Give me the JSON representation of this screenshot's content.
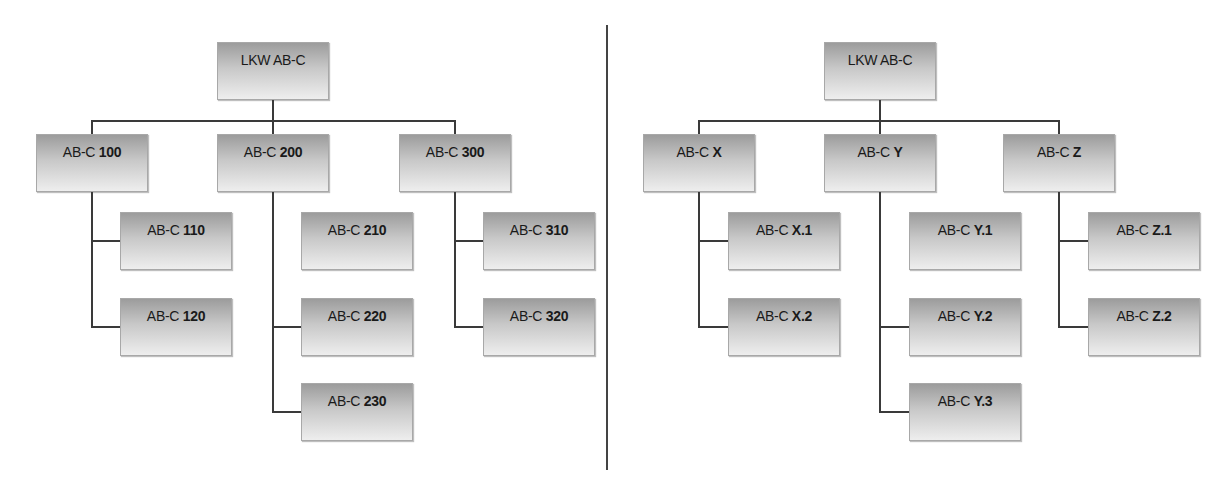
{
  "diagrams": [
    {
      "name": "numbered",
      "root": {
        "prefix": "LKW AB-C",
        "suffix": ""
      },
      "groups": [
        {
          "node": {
            "prefix": "AB-C ",
            "suffix": "100"
          },
          "children": [
            {
              "prefix": "AB-C ",
              "suffix": "110",
              "connected": true
            },
            {
              "prefix": "AB-C ",
              "suffix": "120",
              "connected": true
            }
          ]
        },
        {
          "node": {
            "prefix": "AB-C ",
            "suffix": "200"
          },
          "children": [
            {
              "prefix": "AB-C ",
              "suffix": "210",
              "connected": false
            },
            {
              "prefix": "AB-C ",
              "suffix": "220",
              "connected": true
            },
            {
              "prefix": "AB-C ",
              "suffix": "230",
              "connected": true
            }
          ]
        },
        {
          "node": {
            "prefix": "AB-C ",
            "suffix": "300"
          },
          "children": [
            {
              "prefix": "AB-C ",
              "suffix": "310",
              "connected": true
            },
            {
              "prefix": "AB-C ",
              "suffix": "320",
              "connected": true
            }
          ]
        }
      ]
    },
    {
      "name": "lettered",
      "root": {
        "prefix": "LKW AB-C",
        "suffix": ""
      },
      "groups": [
        {
          "node": {
            "prefix": "AB-C ",
            "suffix": "X"
          },
          "children": [
            {
              "prefix": "AB-C ",
              "suffix": "X.1",
              "connected": true
            },
            {
              "prefix": "AB-C ",
              "suffix": "X.2",
              "connected": true
            }
          ]
        },
        {
          "node": {
            "prefix": "AB-C ",
            "suffix": "Y"
          },
          "children": [
            {
              "prefix": "AB-C ",
              "suffix": "Y.1",
              "connected": false
            },
            {
              "prefix": "AB-C ",
              "suffix": "Y.2",
              "connected": true
            },
            {
              "prefix": "AB-C ",
              "suffix": "Y.3",
              "connected": true
            }
          ]
        },
        {
          "node": {
            "prefix": "AB-C ",
            "suffix": "Z"
          },
          "children": [
            {
              "prefix": "AB-C ",
              "suffix": "Z.1",
              "connected": true
            },
            {
              "prefix": "AB-C ",
              "suffix": "Z.2",
              "connected": true
            }
          ]
        }
      ]
    }
  ]
}
